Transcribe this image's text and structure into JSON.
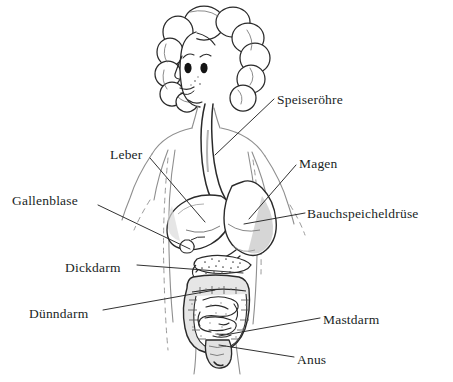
{
  "diagram": {
    "style": "hand-drawn black and white line drawing",
    "background_color": "#ffffff",
    "ink_color": "#211f1f",
    "body_outline_color": "#8c8c8c",
    "organ_shading_color": "#c9c9c9",
    "labels": [
      {
        "id": "speiseroehre",
        "text": "Speiseröhre",
        "x": 277,
        "y": 93,
        "organ": "esophagus"
      },
      {
        "id": "leber",
        "text": "Leber",
        "x": 110,
        "y": 148,
        "organ": "liver"
      },
      {
        "id": "magen",
        "text": "Magen",
        "x": 299,
        "y": 157,
        "organ": "stomach"
      },
      {
        "id": "gallenblase",
        "text": "Gallenblase",
        "x": 12,
        "y": 194,
        "organ": "gallbladder"
      },
      {
        "id": "bauchspeicheldruese",
        "text": "Bauchspeicheldrüse",
        "x": 307,
        "y": 207,
        "organ": "pancreas"
      },
      {
        "id": "dickdarm",
        "text": "Dickdarm",
        "x": 65,
        "y": 261,
        "organ": "large intestine"
      },
      {
        "id": "duenndarm",
        "text": "Dünndarm",
        "x": 29,
        "y": 307,
        "organ": "small intestine"
      },
      {
        "id": "mastdarm",
        "text": "Mastdarm",
        "x": 323,
        "y": 313,
        "organ": "rectum"
      },
      {
        "id": "anus",
        "text": "Anus",
        "x": 297,
        "y": 353,
        "organ": "anus"
      }
    ],
    "leader_lines": [
      {
        "id": "speiseroehre-leader",
        "from": [
          274,
          99
        ],
        "to": [
          215,
          155
        ]
      },
      {
        "id": "leber-leader",
        "from": [
          150,
          158
        ],
        "to": [
          205,
          222
        ]
      },
      {
        "id": "magen-leader",
        "from": [
          296,
          165
        ],
        "to": [
          249,
          219
        ]
      },
      {
        "id": "gallenblase-leader",
        "from": [
          98,
          205
        ],
        "to": [
          190,
          249
        ]
      },
      {
        "id": "bauchspeicheldruese-leader",
        "from": [
          305,
          213
        ],
        "to": [
          270,
          222
        ]
      },
      {
        "id": "dickdarm-leader",
        "from": [
          137,
          265
        ],
        "to": [
          243,
          273
        ]
      },
      {
        "id": "duenndarm-leader",
        "from": [
          103,
          310
        ],
        "to": [
          215,
          290
        ]
      },
      {
        "id": "mastdarm-leader",
        "from": [
          320,
          318
        ],
        "to": [
          219,
          336
        ]
      },
      {
        "id": "anus-leader",
        "from": [
          294,
          357
        ],
        "to": [
          219,
          345
        ]
      }
    ]
  }
}
